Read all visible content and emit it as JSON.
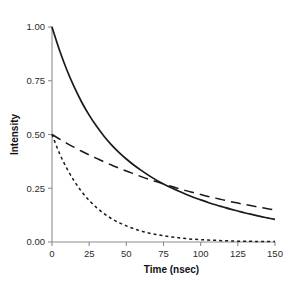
{
  "chart_data": {
    "type": "line",
    "title": "",
    "xlabel": "Time (nsec)",
    "ylabel": "Intensity",
    "xlim": [
      0,
      150
    ],
    "ylim": [
      0.0,
      1.0
    ],
    "xticks": [
      0,
      25,
      50,
      75,
      100,
      125,
      150
    ],
    "xtick_labels": [
      "0",
      "25",
      "50",
      "75",
      "100",
      "125",
      "150"
    ],
    "yticks": [
      0.0,
      0.25,
      0.5,
      0.75,
      1.0
    ],
    "ytick_labels": [
      "0.00",
      "0.25",
      "0.50",
      "0.75",
      "1.00"
    ],
    "grid": false,
    "legend": "none",
    "spines": [
      "left",
      "bottom"
    ],
    "line_color": "#1a1a1a",
    "background": "#ffffff",
    "x": [
      0,
      5,
      10,
      15,
      20,
      25,
      30,
      35,
      40,
      45,
      50,
      55,
      60,
      65,
      70,
      75,
      80,
      85,
      90,
      95,
      100,
      105,
      110,
      115,
      120,
      125,
      130,
      135,
      140,
      145,
      150
    ],
    "series": [
      {
        "name": "total-decay",
        "style": "solid",
        "dash": "none",
        "values": [
          1.0,
          0.893,
          0.8,
          0.72,
          0.65,
          0.59,
          0.538,
          0.492,
          0.452,
          0.417,
          0.386,
          0.358,
          0.333,
          0.31,
          0.289,
          0.27,
          0.253,
          0.237,
          0.222,
          0.208,
          0.196,
          0.184,
          0.173,
          0.163,
          0.153,
          0.144,
          0.135,
          0.127,
          0.119,
          0.112,
          0.105
        ]
      },
      {
        "name": "slow-component",
        "style": "dashed-long",
        "dash": "10 6",
        "values": [
          0.5,
          0.479,
          0.459,
          0.44,
          0.422,
          0.405,
          0.389,
          0.373,
          0.358,
          0.344,
          0.33,
          0.317,
          0.304,
          0.292,
          0.281,
          0.27,
          0.259,
          0.249,
          0.239,
          0.23,
          0.221,
          0.212,
          0.204,
          0.196,
          0.188,
          0.181,
          0.174,
          0.167,
          0.161,
          0.155,
          0.149
        ]
      },
      {
        "name": "fast-component",
        "style": "dashed-short",
        "dash": "3 3",
        "values": [
          0.5,
          0.413,
          0.342,
          0.283,
          0.234,
          0.193,
          0.16,
          0.132,
          0.109,
          0.09,
          0.075,
          0.062,
          0.051,
          0.042,
          0.035,
          0.029,
          0.024,
          0.02,
          0.016,
          0.013,
          0.011,
          0.009,
          0.008,
          0.006,
          0.005,
          0.004,
          0.004,
          0.003,
          0.002,
          0.002,
          0.002
        ]
      }
    ]
  }
}
